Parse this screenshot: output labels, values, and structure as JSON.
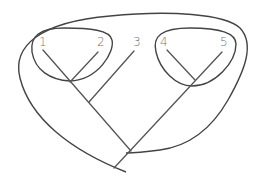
{
  "diagram": {
    "type": "cladogram",
    "colors": {
      "line": "#555555",
      "outline": "#444444",
      "label": "#777777",
      "background": "#ffffff"
    },
    "taxa": [
      {
        "id": "1",
        "label": "1"
      },
      {
        "id": "2",
        "label": "2"
      },
      {
        "id": "3",
        "label": "3"
      },
      {
        "id": "4",
        "label": "4"
      },
      {
        "id": "5",
        "label": "5"
      }
    ],
    "groups": [
      {
        "name": "clade-1-2",
        "members": [
          "1",
          "2"
        ]
      },
      {
        "name": "clade-4-5",
        "members": [
          "4",
          "5"
        ]
      },
      {
        "name": "clade-all",
        "members": [
          "1",
          "2",
          "3",
          "4",
          "5"
        ]
      }
    ]
  }
}
